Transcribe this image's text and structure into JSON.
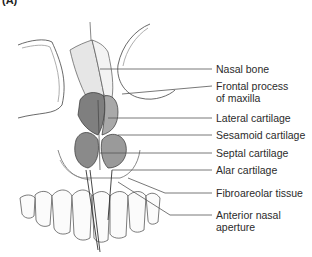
{
  "figure": {
    "panel_label": "(A)",
    "labels": [
      {
        "id": "nasal-bone",
        "line1": "Nasal bone",
        "line2": ""
      },
      {
        "id": "frontal-process",
        "line1": "Frontal process",
        "line2": "of maxilla"
      },
      {
        "id": "lateral-cartilage",
        "line1": "Lateral cartilage",
        "line2": ""
      },
      {
        "id": "sesamoid-cartilage",
        "line1": "Sesamoid cartilage",
        "line2": ""
      },
      {
        "id": "septal-cartilage",
        "line1": "Septal cartilage",
        "line2": ""
      },
      {
        "id": "alar-cartilage",
        "line1": "Alar cartilage",
        "line2": ""
      },
      {
        "id": "fibroareolar-tissue",
        "line1": "Fibroareolar tissue",
        "line2": ""
      },
      {
        "id": "anterior-nasal-aperture",
        "line1": "Anterior nasal",
        "line2": "aperture"
      }
    ],
    "colors": {
      "line": "#555555",
      "text": "#2b2b2b",
      "cartilage": "#8a8a8a",
      "bone": "#f2f2f2"
    }
  }
}
